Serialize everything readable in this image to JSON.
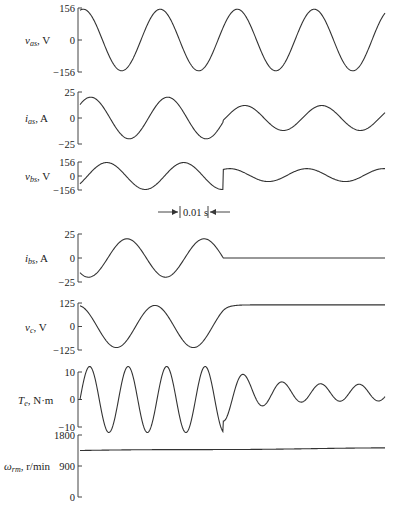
{
  "chart_data": {
    "type": "line",
    "title": "",
    "xlabel": "time",
    "time_scale_annotation": "0.01 s",
    "xlim_s": [
      0,
      0.066
    ],
    "event_time_s": 0.031,
    "frequency_hz": 60,
    "panels": [
      {
        "id": "vas",
        "ylabel_main": "v",
        "ylabel_sub": "as",
        "ylabel_unit": ", V",
        "ylim": [
          -156,
          156
        ],
        "ticks": [
          {
            "value": 156,
            "label": "156"
          },
          {
            "value": 0,
            "label": "0"
          },
          {
            "value": -156,
            "label": "−156"
          }
        ],
        "description": "60 Hz sinusoid, amplitude 156 V throughout",
        "series": {
          "before": {
            "amp": 150,
            "phase_deg": 75,
            "freq_mult": 1
          },
          "after": {
            "amp": 150,
            "phase_deg": 75,
            "freq_mult": 1
          }
        }
      },
      {
        "id": "ias",
        "ylabel_main": "i",
        "ylabel_sub": "as",
        "ylabel_unit": ", A",
        "ylim": [
          -25,
          25
        ],
        "ticks": [
          {
            "value": 25,
            "label": "25"
          },
          {
            "value": 0,
            "label": "0"
          },
          {
            "value": -25,
            "label": "−25"
          }
        ],
        "description": "sinusoid ~20 A before event, decays to ~12 A after",
        "series": {
          "before": {
            "amp": 20,
            "phase_deg": 40,
            "freq_mult": 1
          },
          "after": {
            "amp": 12,
            "phase_deg": 40,
            "freq_mult": 1
          }
        }
      },
      {
        "id": "vbs",
        "ylabel_main": "v",
        "ylabel_sub": "bs",
        "ylabel_unit": ", V",
        "ylim": [
          -156,
          156
        ],
        "ticks": [
          {
            "value": 156,
            "label": "156"
          },
          {
            "value": 0,
            "label": "0"
          },
          {
            "value": -156,
            "label": "−156"
          }
        ],
        "description": "sinusoid ~156 V before event, ~70 V after",
        "series": {
          "before": {
            "amp": 150,
            "phase_deg": -35,
            "freq_mult": 1
          },
          "after": {
            "amp": 72,
            "phase_deg": 110,
            "freq_mult": 1,
            "offset": 10
          }
        }
      },
      {
        "id": "ibs",
        "ylabel_main": "i",
        "ylabel_sub": "bs",
        "ylabel_unit": ", A",
        "ylim": [
          -25,
          25
        ],
        "ticks": [
          {
            "value": 25,
            "label": "25"
          },
          {
            "value": 0,
            "label": "0"
          },
          {
            "value": -25,
            "label": "−25"
          }
        ],
        "description": "sinusoid ~20 A before event, 0 A after",
        "series": {
          "before": {
            "amp": 20,
            "phase_deg": -130,
            "freq_mult": 1
          },
          "after": {
            "amp": 0,
            "phase_deg": 0,
            "freq_mult": 1
          }
        }
      },
      {
        "id": "vc",
        "ylabel_main": "v",
        "ylabel_sub": "c",
        "ylabel_unit": ", V",
        "ylim": [
          -125,
          125
        ],
        "ticks": [
          {
            "value": 125,
            "label": "125"
          },
          {
            "value": 0,
            "label": "0"
          },
          {
            "value": -125,
            "label": "−125"
          }
        ],
        "description": "sinusoid ~115 V before event, constant ~115 V after",
        "series": {
          "before": {
            "amp": 112,
            "phase_deg": 100,
            "freq_mult": 1
          },
          "after": {
            "dc": 115
          }
        }
      },
      {
        "id": "te",
        "ylabel_main": "T",
        "ylabel_sub": "e",
        "ylabel_unit": ", N·m",
        "ylim": [
          -10,
          10
        ],
        "ticks": [
          {
            "value": 10,
            "label": "10"
          },
          {
            "value": 0,
            "label": "0"
          },
          {
            "value": -10,
            "label": "−10"
          }
        ],
        "description": "120 Hz pulsation ~±12 N·m before event, ~3 ± 3 N·m after",
        "series": {
          "before": {
            "amp": 12,
            "phase_deg": 0,
            "freq_mult": 2,
            "offset": 0
          },
          "after": {
            "amp": 3,
            "phase_deg": 0,
            "freq_mult": 2,
            "offset": 2.5
          }
        }
      },
      {
        "id": "wrm",
        "ylabel_main": "ω",
        "ylabel_sub": "rm",
        "ylabel_unit": ", r/min",
        "ylim": [
          0,
          1800
        ],
        "ticks": [
          {
            "value": 1800,
            "label": "1800"
          },
          {
            "value": 900,
            "label": "900"
          },
          {
            "value": 0,
            "label": "0"
          }
        ],
        "description": "speed ~1350 r/min rising slowly to ~1420 r/min",
        "series": {
          "ramp": [
            1350,
            1420
          ]
        }
      }
    ]
  }
}
